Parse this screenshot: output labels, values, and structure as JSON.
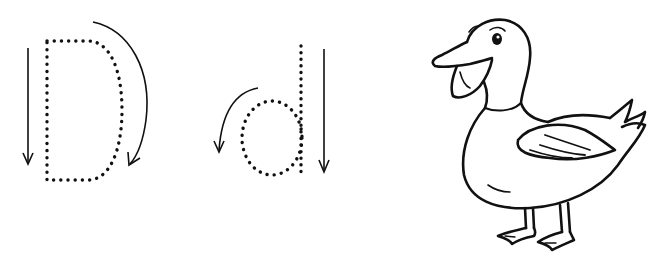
{
  "worksheet": {
    "letter_upper": "D",
    "letter_lower": "d",
    "picture": "duck",
    "colors": {
      "background": "#ffffff",
      "ink": "#111111"
    },
    "icons": {
      "upper_stroke_arrow": "arrow-down-icon",
      "upper_curve_arrow": "curved-arrow-clockwise-icon",
      "lower_curve_arrow": "curved-arrow-counterclockwise-icon",
      "lower_stroke_arrow": "arrow-down-icon"
    }
  }
}
